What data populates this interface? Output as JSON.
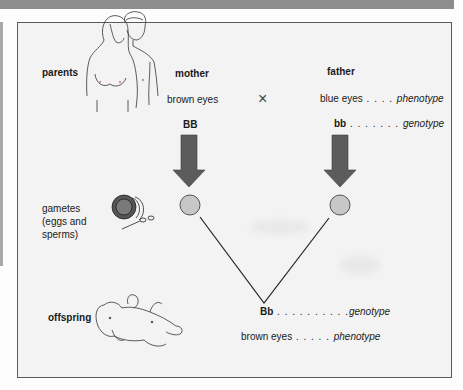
{
  "rows": {
    "parents": {
      "label": "parents"
    },
    "gametes": {
      "label_lines": [
        "gametes",
        "(eggs and",
        "sperms)"
      ]
    },
    "offspring": {
      "label": "offspring"
    }
  },
  "mother": {
    "title": "mother",
    "phenotype": "brown eyes",
    "genotype": "BB",
    "gamete": "B"
  },
  "father": {
    "title": "father",
    "phenotype": "blue eyes",
    "phenotype_dots": " . . . . ",
    "phenotype_term": "phenotype",
    "genotype": "bb",
    "genotype_dots": " . . . . . . . ",
    "genotype_term": "genotype",
    "gamete": "b"
  },
  "cross_symbol": "×",
  "offspring": {
    "genotype": "Bb",
    "genotype_dots": " . . . . . . . . . .",
    "genotype_term": "genotype",
    "phenotype": "brown eyes",
    "phenotype_dots": " . . . . . ",
    "phenotype_term": "phenotype"
  },
  "colors": {
    "arrow": "#5c5c5c",
    "gamete_fill": "#c7c7c7",
    "frame_border": "#5a5a5a",
    "band": "#8d8d8d"
  },
  "icons": [
    "parents-illustration",
    "gametes-illustration",
    "baby-illustration",
    "down-arrow-icon",
    "cross-icon"
  ]
}
